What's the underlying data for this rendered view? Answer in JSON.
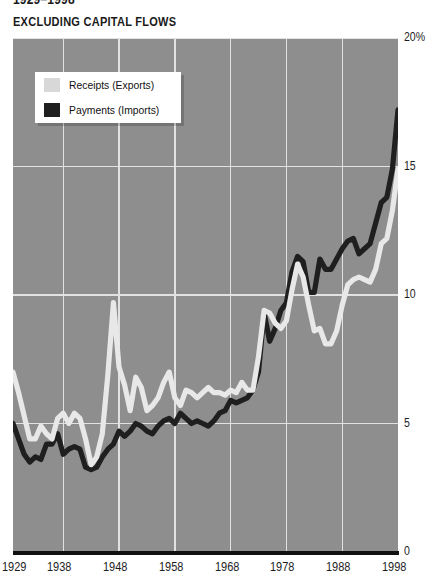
{
  "header": {
    "title_clipped": "1929–1998",
    "subtitle": "EXCLUDING CAPITAL FLOWS"
  },
  "legend": {
    "items": [
      {
        "label": "Receipts (Exports)",
        "color": "#d8d8d8",
        "swatch": "light-swatch"
      },
      {
        "label": "Payments (Imports)",
        "color": "#1f1f1f",
        "swatch": "dark-swatch"
      }
    ]
  },
  "axis": {
    "y_ticks": [
      "20%",
      "15",
      "10",
      "5",
      "0"
    ],
    "x_ticks": [
      "1929",
      "1938",
      "1948",
      "1958",
      "1968",
      "1978",
      "1988",
      "1998"
    ]
  },
  "colors": {
    "plot_background": "#8e8e8e",
    "gridline": "#e2e2e2",
    "receipts": "#e8e8e8",
    "payments": "#1f1f1f",
    "axis_rule": "#111111",
    "text": "#1a1a1a"
  },
  "chart_data": {
    "type": "line",
    "title": "1929–1998",
    "subtitle": "EXCLUDING CAPITAL FLOWS",
    "xlabel": "",
    "ylabel": "Percent of GDP",
    "xlim": [
      1929,
      1998
    ],
    "ylim": [
      0,
      20
    ],
    "y_unit": "%",
    "grid": true,
    "legend_position": "upper-left-inside",
    "x": [
      1929,
      1930,
      1931,
      1932,
      1933,
      1934,
      1935,
      1936,
      1937,
      1938,
      1939,
      1940,
      1941,
      1942,
      1943,
      1944,
      1945,
      1946,
      1947,
      1948,
      1949,
      1950,
      1951,
      1952,
      1953,
      1954,
      1955,
      1956,
      1957,
      1958,
      1959,
      1960,
      1961,
      1962,
      1963,
      1964,
      1965,
      1966,
      1967,
      1968,
      1969,
      1970,
      1971,
      1972,
      1973,
      1974,
      1975,
      1976,
      1977,
      1978,
      1979,
      1980,
      1981,
      1982,
      1983,
      1984,
      1985,
      1986,
      1987,
      1988,
      1989,
      1990,
      1991,
      1992,
      1993,
      1994,
      1995,
      1996,
      1997,
      1998
    ],
    "series": [
      {
        "name": "Receipts (Exports)",
        "color": "#e8e8e8",
        "values": [
          7.0,
          6.2,
          5.3,
          4.4,
          4.4,
          4.9,
          4.6,
          4.4,
          5.2,
          5.4,
          5.0,
          5.4,
          5.2,
          4.4,
          3.4,
          3.7,
          4.6,
          6.9,
          9.7,
          7.2,
          6.5,
          5.5,
          6.8,
          6.4,
          5.5,
          5.7,
          6.0,
          6.6,
          7.0,
          6.0,
          5.7,
          6.3,
          6.2,
          6.0,
          6.2,
          6.4,
          6.2,
          6.2,
          6.1,
          6.3,
          6.2,
          6.6,
          6.3,
          6.3,
          7.6,
          9.4,
          9.3,
          8.9,
          8.7,
          9.0,
          10.2,
          11.2,
          10.7,
          9.6,
          8.6,
          8.7,
          8.1,
          8.1,
          8.6,
          9.6,
          10.4,
          10.6,
          10.7,
          10.6,
          10.5,
          11.0,
          12.0,
          12.2,
          13.3,
          14.9
        ]
      },
      {
        "name": "Payments (Imports)",
        "color": "#1f1f1f",
        "values": [
          5.0,
          4.4,
          3.8,
          3.5,
          3.7,
          3.6,
          4.2,
          4.2,
          4.6,
          3.8,
          4.0,
          4.1,
          4.0,
          3.3,
          3.2,
          3.3,
          3.7,
          4.0,
          4.2,
          4.7,
          4.5,
          4.7,
          5.0,
          4.9,
          4.7,
          4.6,
          4.9,
          5.1,
          5.2,
          5.0,
          5.4,
          5.2,
          5.0,
          5.1,
          5.0,
          4.9,
          5.1,
          5.4,
          5.5,
          5.9,
          5.8,
          5.9,
          6.0,
          6.3,
          7.0,
          9.3,
          8.2,
          8.7,
          9.4,
          9.7,
          10.9,
          11.5,
          11.3,
          10.1,
          10.1,
          11.4,
          11.0,
          11.0,
          11.4,
          11.8,
          12.1,
          12.2,
          11.6,
          11.8,
          12.0,
          12.8,
          13.6,
          13.8,
          14.9,
          17.2
        ]
      }
    ]
  }
}
